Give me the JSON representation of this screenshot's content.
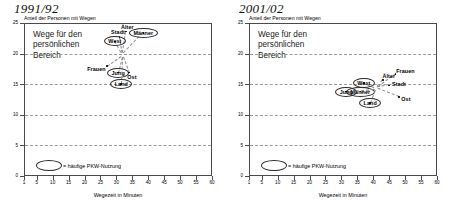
{
  "axis": {
    "yticks": [
      "0",
      "5",
      "10",
      "15",
      "20",
      "25"
    ],
    "xticks": [
      "1",
      "5",
      "10",
      "15",
      "20",
      "25",
      "30",
      "35",
      "40",
      "45",
      "50",
      "55",
      "60"
    ],
    "ylabel": "Anteil der Personen mit Wegen",
    "xlabel": "Wegezeit in Minuten"
  },
  "legend": {
    "text": "= häufige PKW-Nutzung"
  },
  "panels": [
    {
      "period": "1991/92",
      "inner_title_lines": [
        "Wege für den",
        "persönlichen",
        "Bereich"
      ]
    },
    {
      "period": "2001/02",
      "inner_title_lines": [
        "Wege für den",
        "persönlichen",
        "Bereich"
      ]
    }
  ],
  "chart_data": [
    {
      "type": "scatter",
      "title": "1991/92",
      "subtitle": "Wege für den persönlichen Bereich",
      "xlabel": "Wegezeit in Minuten",
      "ylabel": "Anteil der Personen mit Wegen",
      "xlim": [
        1,
        60
      ],
      "ylim": [
        0,
        25
      ],
      "grid": true,
      "legend_note": "= häufige PKW-Nutzung (Ellipse markiert)",
      "points": [
        {
          "label": "Älter",
          "x": 33.0,
          "y": 23.6,
          "ellipse": false
        },
        {
          "label": "Männer",
          "x": 38.5,
          "y": 23.4,
          "ellipse": true
        },
        {
          "label": "Stadt",
          "x": 31.0,
          "y": 22.7,
          "ellipse": false
        },
        {
          "label": "West",
          "x": 29.5,
          "y": 22.0,
          "ellipse": true
        },
        {
          "label": "Frauen",
          "x": 27.0,
          "y": 18.0,
          "ellipse": false
        },
        {
          "label": "Jung",
          "x": 30.5,
          "y": 16.9,
          "ellipse": true
        },
        {
          "label": "Ost",
          "x": 34.0,
          "y": 16.9,
          "ellipse": false
        },
        {
          "label": "Land",
          "x": 31.5,
          "y": 15.0,
          "ellipse": true
        }
      ]
    },
    {
      "type": "scatter",
      "title": "2001/02",
      "subtitle": "Wege für den persönlichen Bereich",
      "xlabel": "Wegezeit in Minuten",
      "ylabel": "Anteil der Personen mit Wegen",
      "xlim": [
        1,
        60
      ],
      "ylim": [
        0,
        25
      ],
      "grid": true,
      "legend_note": "= häufige PKW-Nutzung (Ellipse markiert)",
      "points": [
        {
          "label": "Frauen",
          "x": 47.0,
          "y": 16.7,
          "ellipse": false
        },
        {
          "label": "Älter",
          "x": 43.0,
          "y": 15.7,
          "ellipse": false
        },
        {
          "label": "West",
          "x": 37.0,
          "y": 15.2,
          "ellipse": true
        },
        {
          "label": "Stadt",
          "x": 45.0,
          "y": 14.8,
          "ellipse": false
        },
        {
          "label": "Männer",
          "x": 36.0,
          "y": 13.8,
          "ellipse": true
        },
        {
          "label": "Jung",
          "x": 31.5,
          "y": 13.8,
          "ellipse": true
        },
        {
          "label": "Ost",
          "x": 48.0,
          "y": 12.9,
          "ellipse": false
        },
        {
          "label": "Land",
          "x": 39.0,
          "y": 11.9,
          "ellipse": true
        }
      ]
    }
  ]
}
